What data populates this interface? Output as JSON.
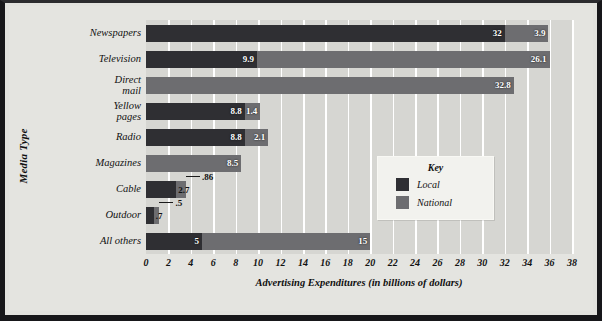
{
  "chart_data": {
    "type": "bar",
    "orientation": "horizontal",
    "stacked": true,
    "title": "",
    "xlabel": "Advertising Expenditures (in billions of dollars)",
    "ylabel": "Media Type",
    "xlim": [
      0,
      38
    ],
    "xticks": [
      0,
      2,
      4,
      6,
      8,
      10,
      12,
      14,
      16,
      18,
      20,
      22,
      24,
      26,
      28,
      30,
      32,
      34,
      36,
      38
    ],
    "xtick_labels": [
      "0",
      "2",
      "4",
      "6",
      "8",
      "10",
      "12",
      "14",
      "16",
      "18",
      "20",
      "22",
      "24",
      "26",
      "28",
      "30",
      "32",
      "34",
      "36",
      "38"
    ],
    "grid": true,
    "grid_axis": "x",
    "legend": {
      "title": "Key",
      "position": "inside-right",
      "entries": [
        {
          "name": "Local",
          "color": "#2f2f33"
        },
        {
          "name": "National",
          "color": "#6d6d70"
        }
      ]
    },
    "categories": [
      "Newspapers",
      "Television",
      "Direct mail",
      "Yellow pages",
      "Radio",
      "Magazines",
      "Cable",
      "Outdoor",
      "All others"
    ],
    "series": [
      {
        "name": "Local",
        "color": "#2f2f33",
        "values": [
          32,
          9.9,
          null,
          8.8,
          8.8,
          null,
          2.7,
          0.7,
          5
        ],
        "labels": [
          "32",
          "9.9",
          "",
          "8.8",
          "8.8",
          "",
          "2.7",
          ".7",
          "5"
        ]
      },
      {
        "name": "National",
        "color": "#6d6d70",
        "values": [
          3.9,
          26.1,
          32.8,
          1.4,
          2.1,
          8.5,
          0.86,
          0.5,
          15
        ],
        "labels": [
          "3.9",
          "26.1",
          "32.8",
          "1.4",
          "2.1",
          "8.5",
          ".86",
          ".5",
          "15"
        ]
      }
    ],
    "totals": [
      35.9,
      36.0,
      32.8,
      10.2,
      10.9,
      8.5,
      3.56,
      1.2,
      20
    ],
    "plot_background": "#d6d6d2",
    "page_background": "#e4e4e0"
  },
  "axes": {
    "y_title": "Media Type",
    "x_title": "Advertising Expenditures (in billions of dollars)"
  },
  "key": {
    "title": "Key",
    "local_label": "Local",
    "national_label": "National"
  },
  "categories": {
    "c0_line1": "Newspapers",
    "c0_line2": "",
    "c1_line1": "Television",
    "c1_line2": "",
    "c2_line1": "Direct",
    "c2_line2": "mail",
    "c3_line1": "Yellow",
    "c3_line2": "pages",
    "c4_line1": "Radio",
    "c4_line2": "",
    "c5_line1": "Magazines",
    "c5_line2": "",
    "c6_line1": "Cable",
    "c6_line2": "",
    "c7_line1": "Outdoor",
    "c7_line2": "",
    "c8_line1": "All others",
    "c8_line2": ""
  },
  "values": {
    "newspapers_local": "32",
    "newspapers_national": "3.9",
    "television_local": "9.9",
    "television_national": "26.1",
    "directmail_national": "32.8",
    "yellowpages_local": "8.8",
    "yellowpages_national": "1.4",
    "radio_local": "8.8",
    "radio_national": "2.1",
    "magazines_national": "8.5",
    "cable_local": "2.7",
    "cable_national": ".86",
    "outdoor_local": ".7",
    "outdoor_national": ".5",
    "allothers_local": "5",
    "allothers_national": "15"
  }
}
